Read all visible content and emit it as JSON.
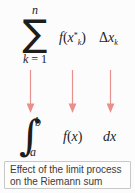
{
  "figure": {
    "background_color": "#fcfcfc",
    "text_color": "#1d1d1d",
    "arrow_color": "#e8908c"
  },
  "riemann_sum": {
    "sigma_symbol": "∑",
    "upper_limit": "n",
    "lower_limit_index": "k",
    "lower_limit_equals": " = ",
    "lower_limit_value": "1",
    "function_term": {
      "f": "f",
      "open_paren": "(",
      "variable": "x",
      "superscript": "*",
      "subscript": "k",
      "close_paren": ")"
    },
    "width_term": {
      "delta": "Δ",
      "variable": "x",
      "subscript": "k"
    }
  },
  "arrows": {
    "icon_name": "down-arrow-icon",
    "color": "#e8908c",
    "count": 3,
    "positions_x": [
      30,
      72,
      110
    ]
  },
  "definite_integral": {
    "integral_symbol": "∫",
    "upper_limit": "b",
    "lower_limit": "a",
    "function_term": {
      "f": "f",
      "open_paren": "(",
      "variable": "x",
      "close_paren": ")"
    },
    "differential_term": "dx"
  },
  "caption": {
    "line1": "Effect of the limit process",
    "line2": "on the Riemann sum",
    "border_color": "#c8c8c8"
  }
}
